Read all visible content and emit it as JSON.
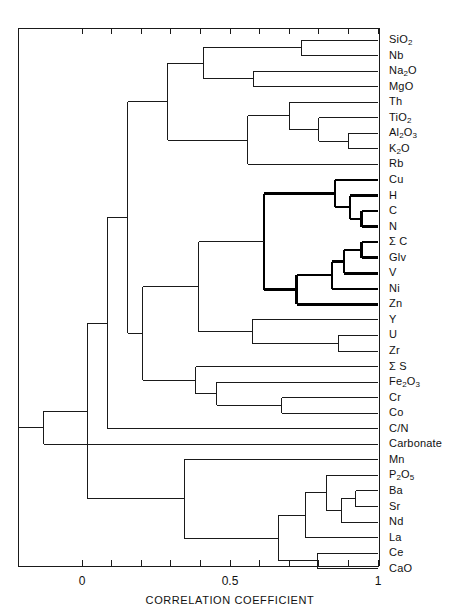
{
  "chart_data": {
    "type": "dendrogram",
    "title": "",
    "xlabel": "CORRELATION COEFFICIENT",
    "ylabel": "",
    "xlim": [
      -0.25,
      1.0
    ],
    "xticks": [
      0,
      0.1,
      0.2,
      0.3,
      0.4,
      0.5,
      0.6,
      0.7,
      0.8,
      0.9,
      1.0
    ],
    "xtick_labels": [
      "0",
      "",
      "",
      "",
      "",
      "0.5",
      "",
      "",
      "",
      "",
      "1"
    ],
    "grid": false,
    "legend": null,
    "orientation": "horizontal-right-leaves",
    "leaves": [
      {
        "index": 0,
        "label": "SiO2",
        "label_html": "SiO<sub>2</sub>"
      },
      {
        "index": 1,
        "label": "Nb",
        "label_html": "Nb"
      },
      {
        "index": 2,
        "label": "Na2O",
        "label_html": "Na<sub>2</sub>O"
      },
      {
        "index": 3,
        "label": "MgO",
        "label_html": "MgO"
      },
      {
        "index": 4,
        "label": "Th",
        "label_html": "Th"
      },
      {
        "index": 5,
        "label": "TiO2",
        "label_html": "TiO<sub>2</sub>"
      },
      {
        "index": 6,
        "label": "Al2O3",
        "label_html": "Al<sub>2</sub>O<sub>3</sub>"
      },
      {
        "index": 7,
        "label": "K2O",
        "label_html": "K<sub>2</sub>O"
      },
      {
        "index": 8,
        "label": "Rb",
        "label_html": "Rb"
      },
      {
        "index": 9,
        "label": "Cu",
        "label_html": "Cu"
      },
      {
        "index": 10,
        "label": "H",
        "label_html": "H"
      },
      {
        "index": 11,
        "label": "C",
        "label_html": "C"
      },
      {
        "index": 12,
        "label": "N",
        "label_html": "N"
      },
      {
        "index": 13,
        "label": "Σ C",
        "label_html": "Σ C"
      },
      {
        "index": 14,
        "label": "Glv",
        "label_html": "Glv"
      },
      {
        "index": 15,
        "label": "V",
        "label_html": "V"
      },
      {
        "index": 16,
        "label": "Ni",
        "label_html": "Ni"
      },
      {
        "index": 17,
        "label": "Zn",
        "label_html": "Zn"
      },
      {
        "index": 18,
        "label": "Y",
        "label_html": "Y"
      },
      {
        "index": 19,
        "label": "U",
        "label_html": "U"
      },
      {
        "index": 20,
        "label": "Zr",
        "label_html": "Zr"
      },
      {
        "index": 21,
        "label": "Σ S",
        "label_html": "Σ S"
      },
      {
        "index": 22,
        "label": "Fe2O3",
        "label_html": "Fe<sub>2</sub>O<sub>3</sub>"
      },
      {
        "index": 23,
        "label": "Cr",
        "label_html": "Cr"
      },
      {
        "index": 24,
        "label": "Co",
        "label_html": "Co"
      },
      {
        "index": 25,
        "label": "C/N",
        "label_html": "C/N"
      },
      {
        "index": 26,
        "label": "Carbonate",
        "label_html": "Carbonate"
      },
      {
        "index": 27,
        "label": "Mn",
        "label_html": "Mn"
      },
      {
        "index": 28,
        "label": "P2O5",
        "label_html": "P<sub>2</sub>O<sub>5</sub>"
      },
      {
        "index": 29,
        "label": "Ba",
        "label_html": "Ba"
      },
      {
        "index": 30,
        "label": "Sr",
        "label_html": "Sr"
      },
      {
        "index": 31,
        "label": "Nd",
        "label_html": "Nd"
      },
      {
        "index": 32,
        "label": "La",
        "label_html": "La"
      },
      {
        "index": 33,
        "label": "Ce",
        "label_html": "Ce"
      },
      {
        "index": 34,
        "label": "CaO",
        "label_html": "CaO"
      }
    ],
    "merges": [
      {
        "id": "m1",
        "left": {
          "leaf": 0
        },
        "right": {
          "leaf": 1
        },
        "height": 0.74,
        "bold": false
      },
      {
        "id": "m2",
        "left": {
          "leaf": 2
        },
        "right": {
          "leaf": 3
        },
        "height": 0.58,
        "bold": false
      },
      {
        "id": "m3",
        "left": {
          "node": "m1"
        },
        "right": {
          "node": "m2"
        },
        "height": 0.41,
        "bold": false
      },
      {
        "id": "m4",
        "left": {
          "leaf": 6
        },
        "right": {
          "leaf": 7
        },
        "height": 0.9,
        "bold": false
      },
      {
        "id": "m5",
        "left": {
          "leaf": 5
        },
        "right": {
          "node": "m4"
        },
        "height": 0.8,
        "bold": false
      },
      {
        "id": "m6",
        "left": {
          "leaf": 4
        },
        "right": {
          "node": "m5"
        },
        "height": 0.7,
        "bold": false
      },
      {
        "id": "m7",
        "left": {
          "node": "m6"
        },
        "right": {
          "leaf": 8
        },
        "height": 0.56,
        "bold": false
      },
      {
        "id": "m8",
        "left": {
          "node": "m3"
        },
        "right": {
          "node": "m7"
        },
        "height": 0.29,
        "bold": false
      },
      {
        "id": "m9",
        "left": {
          "leaf": 11
        },
        "right": {
          "leaf": 12
        },
        "height": 0.945,
        "bold": true
      },
      {
        "id": "m10",
        "left": {
          "leaf": 10
        },
        "right": {
          "node": "m9"
        },
        "height": 0.905,
        "bold": true
      },
      {
        "id": "m11",
        "left": {
          "leaf": 9
        },
        "right": {
          "node": "m10"
        },
        "height": 0.855,
        "bold": true
      },
      {
        "id": "m12",
        "left": {
          "leaf": 13
        },
        "right": {
          "leaf": 14
        },
        "height": 0.945,
        "bold": true
      },
      {
        "id": "m13",
        "left": {
          "node": "m12"
        },
        "right": {
          "leaf": 15
        },
        "height": 0.885,
        "bold": true
      },
      {
        "id": "m14",
        "left": {
          "node": "m13"
        },
        "right": {
          "leaf": 16
        },
        "height": 0.845,
        "bold": true
      },
      {
        "id": "m15",
        "left": {
          "node": "m14"
        },
        "right": {
          "leaf": 17
        },
        "height": 0.725,
        "bold": true
      },
      {
        "id": "m16",
        "left": {
          "node": "m11"
        },
        "right": {
          "node": "m15"
        },
        "height": 0.615,
        "bold": true
      },
      {
        "id": "m17",
        "left": {
          "leaf": 19
        },
        "right": {
          "leaf": 20
        },
        "height": 0.865,
        "bold": false
      },
      {
        "id": "m18",
        "left": {
          "leaf": 18
        },
        "right": {
          "node": "m17"
        },
        "height": 0.575,
        "bold": false
      },
      {
        "id": "m19",
        "left": {
          "node": "m16"
        },
        "right": {
          "node": "m18"
        },
        "height": 0.395,
        "bold": false
      },
      {
        "id": "m20",
        "left": {
          "leaf": 23
        },
        "right": {
          "leaf": 24
        },
        "height": 0.675,
        "bold": false
      },
      {
        "id": "m21",
        "left": {
          "leaf": 22
        },
        "right": {
          "node": "m20"
        },
        "height": 0.455,
        "bold": false
      },
      {
        "id": "m22",
        "left": {
          "leaf": 21
        },
        "right": {
          "node": "m21"
        },
        "height": 0.385,
        "bold": false
      },
      {
        "id": "m23",
        "left": {
          "node": "m19"
        },
        "right": {
          "node": "m22"
        },
        "height": 0.205,
        "bold": false
      },
      {
        "id": "m24",
        "left": {
          "node": "m8"
        },
        "right": {
          "node": "m23"
        },
        "height": 0.155,
        "bold": false
      },
      {
        "id": "m25",
        "left": {
          "node": "m24"
        },
        "right": {
          "leaf": 25
        },
        "height": 0.085,
        "bold": false
      },
      {
        "id": "m26",
        "left": {
          "leaf": 29
        },
        "right": {
          "leaf": 30
        },
        "height": 0.925,
        "bold": false
      },
      {
        "id": "m27",
        "left": {
          "node": "m26"
        },
        "right": {
          "leaf": 31
        },
        "height": 0.875,
        "bold": false
      },
      {
        "id": "m28",
        "left": {
          "leaf": 28
        },
        "right": {
          "node": "m27"
        },
        "height": 0.825,
        "bold": false
      },
      {
        "id": "m29",
        "left": {
          "node": "m28"
        },
        "right": {
          "leaf": 32
        },
        "height": 0.755,
        "bold": false
      },
      {
        "id": "m30",
        "left": {
          "leaf": 33
        },
        "right": {
          "leaf": 34
        },
        "height": 0.795,
        "bold": false
      },
      {
        "id": "m31",
        "left": {
          "node": "m29"
        },
        "right": {
          "node": "m30"
        },
        "height": 0.665,
        "bold": false
      },
      {
        "id": "m32",
        "left": {
          "leaf": 27
        },
        "right": {
          "node": "m31"
        },
        "height": 0.345,
        "bold": false
      },
      {
        "id": "m33",
        "left": {
          "node": "m25"
        },
        "right": {
          "node": "m32"
        },
        "height": 0.02,
        "bold": false
      },
      {
        "id": "m34",
        "left": {
          "node": "m33"
        },
        "right": {
          "leaf": 26
        },
        "height": -0.13,
        "bold": false
      }
    ]
  },
  "axis": {
    "tick_labels": [
      {
        "value": 0,
        "text": "0"
      },
      {
        "value": 0.5,
        "text": "0.5"
      },
      {
        "value": 1,
        "text": "1"
      }
    ],
    "title": "CORRELATION  COEFFICIENT"
  },
  "style": {
    "line_color": "#1a1a1a",
    "bold_line_color": "#000000",
    "frame_color": "#1a1a1a",
    "background": "#ffffff"
  }
}
